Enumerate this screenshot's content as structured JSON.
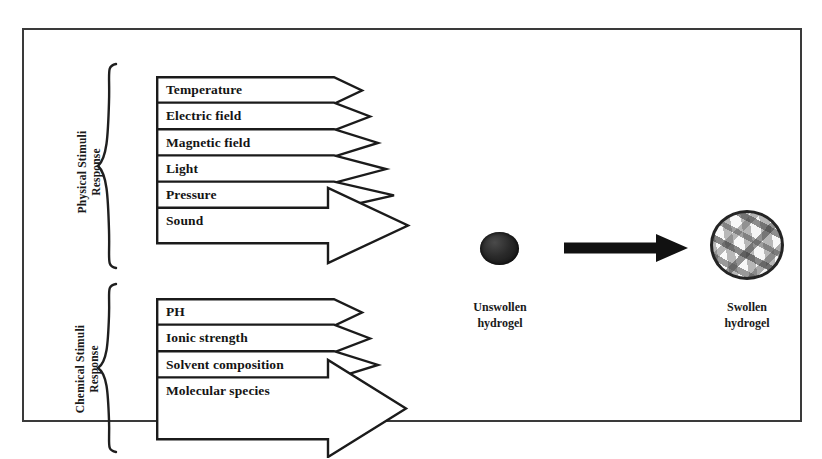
{
  "figure": {
    "frame_color": "#3a3a3a",
    "background": "#ffffff"
  },
  "groups": [
    {
      "id": "physical",
      "label_line1": "Physical Stimuli",
      "label_line2": "Response",
      "brace": "left-curly-brace",
      "items": [
        {
          "label": "Temperature"
        },
        {
          "label": "Electric field"
        },
        {
          "label": "Magnetic field"
        },
        {
          "label": "Light"
        },
        {
          "label": "Pressure"
        },
        {
          "label": "Sound"
        }
      ]
    },
    {
      "id": "chemical",
      "label_line1": "Chemical Stimuli",
      "label_line2": "Response",
      "brace": "left-curly-brace",
      "items": [
        {
          "label": "PH"
        },
        {
          "label": "Ionic strength"
        },
        {
          "label": "Solvent composition"
        },
        {
          "label": "Molecular species"
        }
      ]
    }
  ],
  "illustration": {
    "unswollen": {
      "caption_line1": "Unswollen",
      "caption_line2": "hydrogel",
      "shape": "dark-filled-circle",
      "color": "#1a1a1a"
    },
    "swollen": {
      "caption_line1": "Swollen",
      "caption_line2": "hydrogel",
      "shape": "textured-outlined-circle",
      "color": "#d8d8d8",
      "outline_color": "#242424"
    },
    "arrow": {
      "name": "right-arrow",
      "direction": "right",
      "color": "#111111"
    }
  }
}
